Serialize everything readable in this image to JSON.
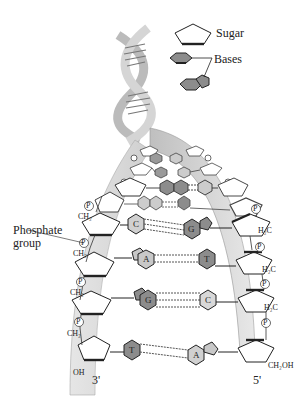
{
  "legend": {
    "sugar_label": "Sugar",
    "bases_label": "Bases"
  },
  "labels": {
    "phosphate_group_line1": "Phosphate",
    "phosphate_group_line2": "group",
    "end_left": "3'",
    "end_right": "5'",
    "oh_left": "OH",
    "ch2oh_right": "CH₂OH",
    "ch2": "CH₂",
    "h2c": "H₂C",
    "phosphate_symbol": "P"
  },
  "base_pairs": [
    {
      "left": "C",
      "right": "G",
      "bonds": 3
    },
    {
      "left": "A",
      "right": "T",
      "bonds": 2
    },
    {
      "left": "G",
      "right": "C",
      "bonds": 3
    },
    {
      "left": "T",
      "right": "A",
      "bonds": 2
    }
  ],
  "colors": {
    "backbone_band": "#d9d9d9",
    "backbone_band_dark": "#bdbdbd",
    "purine_dark": "#8c8c8c",
    "pyrimidine_light": "#c8c8c8",
    "outline": "#222222"
  }
}
